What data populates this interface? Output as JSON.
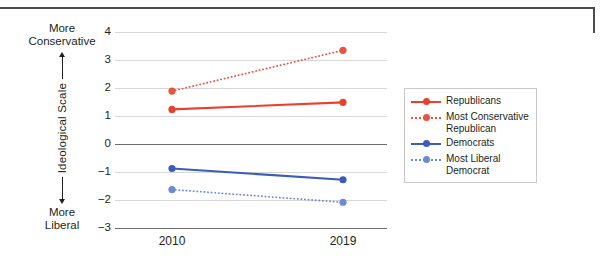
{
  "chart_data": {
    "type": "line",
    "title": "",
    "xlabel": "",
    "ylabel": "Ideological Scale",
    "ylim": [
      -3,
      4
    ],
    "yticks": [
      "4",
      "3",
      "2",
      "1",
      "0",
      "−1",
      "−2",
      "−3"
    ],
    "grid": true,
    "legend_position": "right",
    "categories": [
      "2010",
      "2019"
    ],
    "x": [
      2010,
      2019
    ],
    "axis_top_note": "More\nConservative",
    "axis_bottom_note": "More\nLiberal",
    "series": [
      {
        "name": "Republicans",
        "values": [
          1.25,
          1.5
        ],
        "color": "#e8422e",
        "style": "solid"
      },
      {
        "name": "Most Conservative Republican",
        "values": [
          1.9,
          3.35
        ],
        "color": "#e8553f",
        "style": "dotted"
      },
      {
        "name": "Democrats",
        "values": [
          -0.85,
          -1.25
        ],
        "color": "#3b5cb8",
        "style": "solid"
      },
      {
        "name": "Most Liberal Democrat",
        "values": [
          -1.6,
          -2.05
        ],
        "color": "#6b8ad6",
        "style": "dotted"
      }
    ]
  },
  "axis": {
    "top_line1": "More",
    "top_line2": "Conservative",
    "bottom_line1": "More",
    "bottom_line2": "Liberal",
    "vertical_title": "Ideological Scale",
    "ytick_0": "4",
    "ytick_1": "3",
    "ytick_2": "2",
    "ytick_3": "1",
    "ytick_4": "0",
    "ytick_5": "−1",
    "ytick_6": "−2",
    "ytick_7": "−3",
    "xtick_0": "2010",
    "xtick_1": "2019"
  },
  "legend": {
    "items": [
      {
        "label": "Republicans"
      },
      {
        "label": "Most Conservative Republican"
      },
      {
        "label": "Democrats"
      },
      {
        "label": "Most Liberal Democrat"
      }
    ]
  },
  "colors": {
    "republican_solid": "#e8422e",
    "republican_dotted": "#e8553f",
    "democrat_solid": "#3b5cb8",
    "democrat_dotted": "#6b8ad6",
    "grid": "#d7d7d7",
    "axis": "#6d6e71",
    "rule": "#4d4d4f"
  }
}
